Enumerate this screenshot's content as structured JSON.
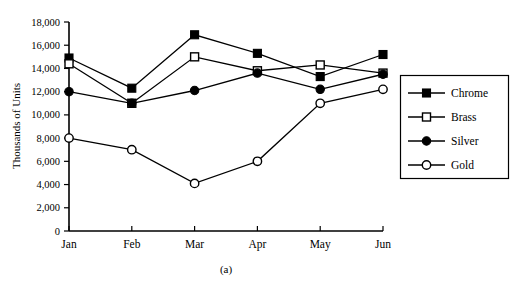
{
  "chart_data": {
    "type": "line",
    "title": "",
    "caption": "(a)",
    "xlabel": "",
    "ylabel": "Thousands of Units",
    "categories": [
      "Jan",
      "Feb",
      "Mar",
      "Apr",
      "May",
      "Jun"
    ],
    "ylim": [
      0,
      18000
    ],
    "ytick_labels": [
      "0",
      "2,000",
      "4,000",
      "6,000",
      "8,000",
      "10,000",
      "12,000",
      "14,000",
      "16,000",
      "18,000"
    ],
    "ytick_values": [
      0,
      2000,
      4000,
      6000,
      8000,
      10000,
      12000,
      14000,
      16000,
      18000
    ],
    "grid": false,
    "legend_position": "right",
    "series": [
      {
        "name": "Chrome",
        "marker": "filled-square",
        "values": [
          14900,
          12300,
          16900,
          15300,
          13300,
          15200
        ]
      },
      {
        "name": "Brass",
        "marker": "open-square",
        "values": [
          14400,
          11000,
          15000,
          13800,
          14300,
          13600
        ]
      },
      {
        "name": "Silver",
        "marker": "filled-circle",
        "values": [
          12000,
          11000,
          12100,
          13600,
          12200,
          13500
        ]
      },
      {
        "name": "Gold",
        "marker": "open-circle",
        "values": [
          8000,
          7000,
          4100,
          6000,
          11000,
          12200
        ]
      }
    ]
  },
  "colors": {
    "ink": "#000000",
    "background": "#ffffff"
  }
}
